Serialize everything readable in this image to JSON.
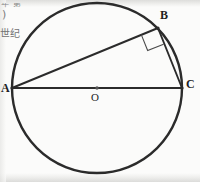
{
  "figure": {
    "type": "circle-geometry-diagram",
    "background_color": "#fbfbfa",
    "stroke_color": "#2b2b2b",
    "circle": {
      "center_x": 97,
      "center_y": 88,
      "radius": 85,
      "stroke_width": 2.4
    },
    "points": [
      {
        "name": "A",
        "label": "A",
        "x": 12,
        "y": 88,
        "role": "diameter-endpoint-left"
      },
      {
        "name": "B",
        "label": "B",
        "x": 158,
        "y": 28,
        "role": "arc-point"
      },
      {
        "name": "C",
        "label": "C",
        "x": 182,
        "y": 88,
        "role": "diameter-endpoint-right"
      },
      {
        "name": "O",
        "label": "O",
        "x": 97,
        "y": 88,
        "role": "center"
      }
    ],
    "segments": [
      {
        "name": "AC",
        "from": "A",
        "to": "C",
        "kind": "diameter"
      },
      {
        "name": "AB",
        "from": "A",
        "to": "B",
        "kind": "chord"
      },
      {
        "name": "BC",
        "from": "B",
        "to": "C",
        "kind": "chord"
      }
    ],
    "right_angle_marker": {
      "at_vertex": "B",
      "size": 17,
      "stroke_width": 1.1,
      "stroke_color": "#4a4a4a"
    },
    "center_dot": {
      "at": "O",
      "radius": 1.7,
      "color": "#555555"
    }
  },
  "margin_text": {
    "line_cut_off": "年 第",
    "line_paren": ")",
    "line_cjk": "世纪"
  },
  "labels": {
    "A": "A",
    "B": "B",
    "C": "C",
    "O": "O"
  }
}
